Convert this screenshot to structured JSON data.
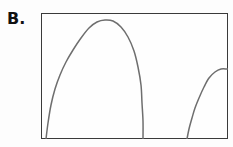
{
  "figure": {
    "panel_label": "B.",
    "background_color": "#fdfdfd",
    "frame_color": "#3a3a3a",
    "curve_color": "#6e6e6e"
  },
  "chart_data": {
    "type": "line",
    "title": "B.",
    "xlabel": "",
    "ylabel": "",
    "grid": false,
    "legend": null,
    "axis_ticks": {
      "x": [],
      "y": []
    },
    "xlim": [
      0,
      187
    ],
    "ylim": [
      0,
      126
    ],
    "series": [
      {
        "name": "main-arch",
        "points": [
          [
            5,
            126
          ],
          [
            7,
            110
          ],
          [
            10,
            92
          ],
          [
            14,
            76
          ],
          [
            19,
            62
          ],
          [
            25,
            49
          ],
          [
            32,
            37
          ],
          [
            40,
            25
          ],
          [
            48,
            15
          ],
          [
            56,
            9
          ],
          [
            64,
            7
          ],
          [
            72,
            8
          ],
          [
            80,
            14
          ],
          [
            87,
            24
          ],
          [
            93,
            38
          ],
          [
            97,
            54
          ],
          [
            100,
            72
          ],
          [
            101,
            90
          ],
          [
            102,
            108
          ],
          [
            102,
            126
          ]
        ]
      },
      {
        "name": "right-rise",
        "points": [
          [
            146,
            126
          ],
          [
            148,
            116
          ],
          [
            151,
            105
          ],
          [
            154,
            95
          ],
          [
            158,
            85
          ],
          [
            163,
            74
          ],
          [
            168,
            65
          ],
          [
            174,
            59
          ],
          [
            180,
            56
          ],
          [
            186,
            56
          ],
          [
            187,
            56
          ]
        ]
      }
    ]
  }
}
